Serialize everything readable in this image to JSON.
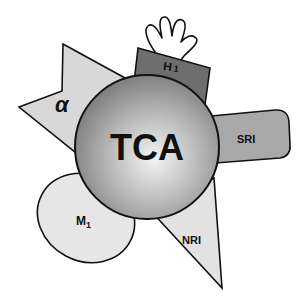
{
  "diagram": {
    "center": {
      "label": "TCA"
    },
    "receptors": [
      {
        "id": "alpha",
        "label": "α",
        "shape": "arrow-wedge",
        "fill": "#d8d8d8"
      },
      {
        "id": "h1",
        "label": "H",
        "subscript": "1",
        "shape": "rectangle",
        "fill": "#6e6e6e"
      },
      {
        "id": "sri",
        "label": "SRI",
        "shape": "rounded-rectangle",
        "fill": "#a8a8a8"
      },
      {
        "id": "nri",
        "label": "NRI",
        "shape": "triangle",
        "fill": "#e2e2e2"
      },
      {
        "id": "m1",
        "label": "M",
        "subscript": "1",
        "shape": "ellipse",
        "fill": "#e6e6e6"
      }
    ],
    "hand_icon": "hand-outline",
    "colors": {
      "outline": "#111111",
      "sphere_light": "#f2f2f2",
      "sphere_dark": "#7a7a7a"
    }
  }
}
